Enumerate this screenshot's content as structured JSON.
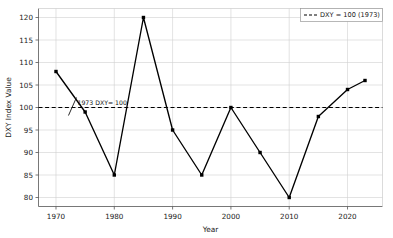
{
  "chart_data": {
    "type": "line",
    "title": "",
    "xlabel": "Year",
    "ylabel": "DXY Index Value",
    "x": [
      1970,
      1975,
      1980,
      1985,
      1990,
      1995,
      2000,
      2005,
      2010,
      2015,
      2020,
      2023
    ],
    "values": [
      108,
      99,
      85,
      120,
      95,
      85,
      100,
      90,
      80,
      98,
      104,
      106
    ],
    "series": [
      {
        "name": "DXY Index",
        "values": [
          108,
          99,
          85,
          120,
          95,
          85,
          100,
          90,
          80,
          98,
          104,
          106
        ]
      }
    ],
    "xlim": [
      1967,
      2026
    ],
    "ylim": [
      78,
      122
    ],
    "xticks": [
      1970,
      1980,
      1990,
      2000,
      2010,
      2020
    ],
    "xtick_labels": [
      "1970",
      "1980",
      "1990",
      "2000",
      "2010",
      "2020"
    ],
    "yticks": [
      80,
      85,
      90,
      95,
      100,
      105,
      110,
      115,
      120
    ],
    "ytick_labels": [
      "80",
      "85",
      "90",
      "95",
      "100",
      "105",
      "110",
      "115",
      "120"
    ],
    "grid": true,
    "reference_line": {
      "value": 100,
      "style": "dashed",
      "label": "DXY = 100 (1973)"
    },
    "annotations": [
      {
        "text": "1973 DXY= 100",
        "x": 1973,
        "y": 100
      }
    ],
    "legend": {
      "position": "top-right",
      "entries": [
        {
          "label": "DXY = 100 (1973)",
          "style": "dashed",
          "color": "#000000"
        }
      ]
    },
    "colors": {
      "line": "#000000",
      "marker": "#000000",
      "grid": "#d0d0d0",
      "axis": "#555555",
      "reference": "#000000",
      "background": "#ffffff"
    }
  }
}
